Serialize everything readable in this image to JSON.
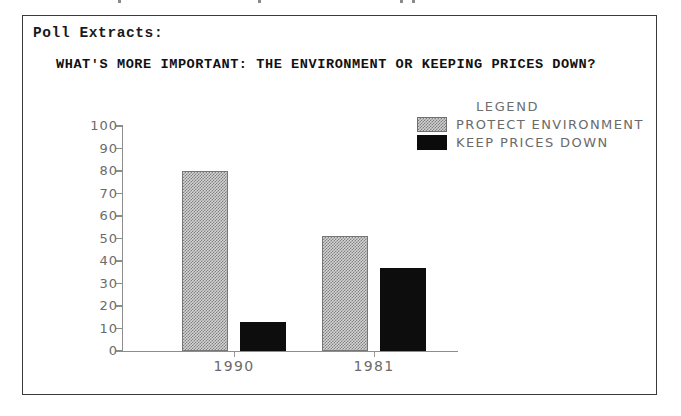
{
  "document": {
    "section_label": "Poll Extracts:"
  },
  "chart_data": {
    "type": "bar",
    "title": "WHAT'S MORE IMPORTANT: THE ENVIRONMENT OR KEEPING PRICES DOWN?",
    "xlabel": "",
    "ylabel": "",
    "ylim": [
      0,
      100
    ],
    "yticks": [
      0,
      10,
      20,
      30,
      40,
      50,
      60,
      70,
      80,
      90,
      100
    ],
    "grid": false,
    "legend_position": "top-right",
    "legend_title": "LEGEND",
    "categories": [
      "1990",
      "1981"
    ],
    "series": [
      {
        "name": "PROTECT ENVIRONMENT",
        "values": [
          80,
          51
        ],
        "fill": "hatch",
        "color": "#d4d4d4"
      },
      {
        "name": "KEEP PRICES DOWN",
        "values": [
          13,
          37
        ],
        "fill": "solid",
        "color": "#0d0d0d"
      }
    ]
  },
  "style": {
    "frame_color": "#3a3a3a",
    "axis_color": "#8d8d8d",
    "tick_text_color": "#6b6b6b",
    "title_color": "#111111"
  }
}
